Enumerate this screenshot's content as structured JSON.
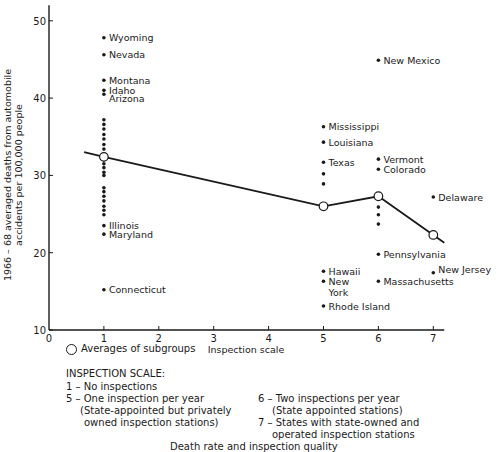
{
  "chart_data": {
    "type": "scatter",
    "title": "",
    "xlabel": "Inspection scale",
    "ylabel": "1966 – 68 averaged deaths from automobile accidents per 100,000 people",
    "ylabel_lines": [
      "1966 – 68 averaged deaths from automobile",
      "accidents per 100,000 people"
    ],
    "xlim": [
      0,
      7.2
    ],
    "ylim": [
      10,
      52
    ],
    "x_ticks": [
      0,
      1,
      2,
      3,
      4,
      5,
      6,
      7
    ],
    "y_ticks": [
      10,
      20,
      30,
      40,
      50
    ],
    "grid": false,
    "series": [
      {
        "name": "States",
        "type": "scatter",
        "points": [
          {
            "x": 1,
            "y": 47.8,
            "label": "Wyoming"
          },
          {
            "x": 1,
            "y": 45.6,
            "label": "Nevada"
          },
          {
            "x": 1,
            "y": 42.3,
            "label": "Montana"
          },
          {
            "x": 1,
            "y": 41.0,
            "label": "Idaho"
          },
          {
            "x": 1,
            "y": 40.5,
            "label": "Arizona"
          },
          {
            "x": 1,
            "y": 37.2,
            "label": ""
          },
          {
            "x": 1,
            "y": 36.6,
            "label": ""
          },
          {
            "x": 1,
            "y": 36.0,
            "label": ""
          },
          {
            "x": 1,
            "y": 35.3,
            "label": ""
          },
          {
            "x": 1,
            "y": 34.7,
            "label": ""
          },
          {
            "x": 1,
            "y": 34.0,
            "label": ""
          },
          {
            "x": 1,
            "y": 33.4,
            "label": ""
          },
          {
            "x": 1,
            "y": 32.0,
            "label": ""
          },
          {
            "x": 1,
            "y": 31.5,
            "label": ""
          },
          {
            "x": 1,
            "y": 31.0,
            "label": ""
          },
          {
            "x": 1,
            "y": 30.4,
            "label": ""
          },
          {
            "x": 1,
            "y": 30.0,
            "label": ""
          },
          {
            "x": 1,
            "y": 28.4,
            "label": ""
          },
          {
            "x": 1,
            "y": 27.9,
            "label": ""
          },
          {
            "x": 1,
            "y": 27.3,
            "label": ""
          },
          {
            "x": 1,
            "y": 26.7,
            "label": ""
          },
          {
            "x": 1,
            "y": 26.0,
            "label": ""
          },
          {
            "x": 1,
            "y": 25.5,
            "label": ""
          },
          {
            "x": 1,
            "y": 24.9,
            "label": ""
          },
          {
            "x": 1,
            "y": 23.5,
            "label": "Illinois"
          },
          {
            "x": 1,
            "y": 22.4,
            "label": "Maryland"
          },
          {
            "x": 1,
            "y": 15.2,
            "label": "Connecticut"
          },
          {
            "x": 5,
            "y": 36.3,
            "label": "Mississippi"
          },
          {
            "x": 5,
            "y": 34.3,
            "label": "Louisiana"
          },
          {
            "x": 5,
            "y": 31.7,
            "label": "Texas"
          },
          {
            "x": 5,
            "y": 30.2,
            "label": ""
          },
          {
            "x": 5,
            "y": 28.9,
            "label": ""
          },
          {
            "x": 5,
            "y": 17.6,
            "label": "Hawaii"
          },
          {
            "x": 5,
            "y": 16.3,
            "label": "New York"
          },
          {
            "x": 5,
            "y": 13.1,
            "label": "Rhode Island"
          },
          {
            "x": 6,
            "y": 44.9,
            "label": "New Mexico"
          },
          {
            "x": 6,
            "y": 32.1,
            "label": "Vermont"
          },
          {
            "x": 6,
            "y": 30.8,
            "label": "Colorado"
          },
          {
            "x": 6,
            "y": 25.9,
            "label": ""
          },
          {
            "x": 6,
            "y": 24.9,
            "label": ""
          },
          {
            "x": 6,
            "y": 23.7,
            "label": ""
          },
          {
            "x": 6,
            "y": 19.8,
            "label": "Pennsylvania"
          },
          {
            "x": 6,
            "y": 16.3,
            "label": "Massachusetts"
          },
          {
            "x": 7,
            "y": 27.2,
            "label": "Delaware"
          },
          {
            "x": 7,
            "y": 17.4,
            "label": "New Jersey"
          }
        ]
      },
      {
        "name": "Averages of subgroups",
        "type": "line",
        "points": [
          {
            "x": 1,
            "y": 32.4
          },
          {
            "x": 5,
            "y": 26.0
          },
          {
            "x": 6,
            "y": 27.3
          },
          {
            "x": 7,
            "y": 22.3
          }
        ],
        "line_extent": [
          {
            "x": 0.64,
            "y": 33.0
          },
          {
            "x": 7.2,
            "y": 21.3
          }
        ]
      }
    ],
    "legend": {
      "position": "bottom-left",
      "entries": [
        "Averages of subgroups"
      ]
    },
    "annotations": [
      "INSPECTION SCALE:",
      "1 – No inspections",
      "5 – One inspection per year (State-appointed but privately owned inspection stations)",
      "6 – Two inspections per year (State appointed stations)",
      "7 – States with state-owned and operated inspection stations"
    ]
  },
  "legend": {
    "avg_label": "Averages of subgroups"
  },
  "scale": {
    "title": "INSPECTION SCALE:",
    "items": [
      {
        "lines": [
          "1 – No inspections"
        ]
      },
      {
        "lines": [
          "5 – One inspection per year",
          "(State-appointed but privately",
          "owned inspection stations)"
        ]
      },
      {
        "lines": [
          "6 – Two inspections per year",
          "(State appointed stations)"
        ]
      },
      {
        "lines": [
          "7 – States with state-owned and",
          "operated inspection stations"
        ]
      }
    ]
  },
  "caption": "Death rate and inspection quality"
}
